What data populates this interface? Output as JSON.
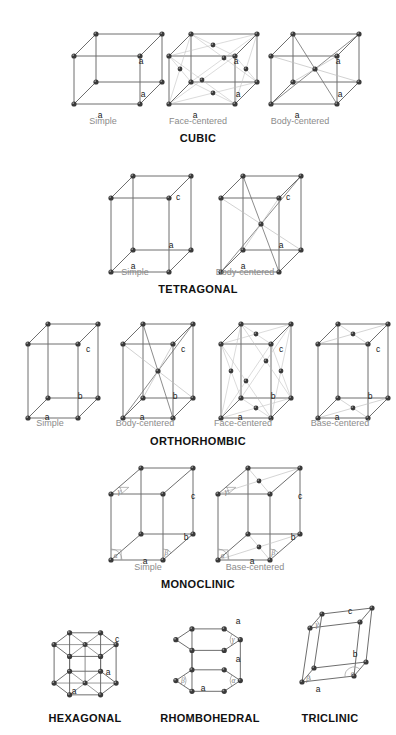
{
  "figure": {
    "title_visible": false,
    "background": "#ffffff",
    "node_color": "#3a3a3a",
    "edge_color": "#6e6e6e",
    "faint_edge_color": "#bdbdbd",
    "label_color": "#8b8b8b",
    "heading_color": "#111111"
  },
  "systems": [
    {
      "name": "CUBIC",
      "heading_x": 198,
      "heading_y": 132,
      "cells": [
        {
          "variant": "Simple",
          "label_x": 103,
          "label_y": 116,
          "shape": "box",
          "ox": 68,
          "oy": 30,
          "w": 66,
          "h": 48,
          "dx": 22,
          "dy": -22,
          "shear": 0,
          "lattice": "P",
          "axes": [
            {
              "text": "a",
              "x": 100,
              "y": 116
            },
            {
              "text": "a",
              "x": 143,
              "y": 95
            },
            {
              "text": "a",
              "x": 141,
              "y": 62
            }
          ]
        },
        {
          "variant": "Face-centered",
          "label_x": 198,
          "label_y": 116,
          "shape": "box",
          "ox": 163,
          "oy": 30,
          "w": 66,
          "h": 48,
          "dx": 22,
          "dy": -22,
          "shear": 0,
          "lattice": "F",
          "axes": [
            {
              "text": "a",
              "x": 195,
              "y": 116
            },
            {
              "text": "a",
              "x": 238,
              "y": 95
            },
            {
              "text": "a",
              "x": 236,
              "y": 62
            }
          ]
        },
        {
          "variant": "Body-centered",
          "label_x": 300,
          "label_y": 116,
          "shape": "box",
          "ox": 265,
          "oy": 30,
          "w": 66,
          "h": 48,
          "dx": 22,
          "dy": -22,
          "shear": 0,
          "lattice": "I",
          "axes": [
            {
              "text": "a",
              "x": 297,
              "y": 116
            },
            {
              "text": "a",
              "x": 340,
              "y": 95
            },
            {
              "text": "a",
              "x": 338,
              "y": 62
            }
          ]
        }
      ]
    },
    {
      "name": "TETRAGONAL",
      "heading_x": 198,
      "heading_y": 283,
      "cells": [
        {
          "variant": "Simple",
          "label_x": 135,
          "label_y": 267,
          "shape": "box",
          "ox": 105,
          "oy": 172,
          "w": 58,
          "h": 74,
          "dx": 22,
          "dy": -22,
          "shear": 0,
          "lattice": "P",
          "axes": [
            {
              "text": "a",
              "x": 133,
              "y": 267
            },
            {
              "text": "a",
              "x": 171,
              "y": 246
            },
            {
              "text": "c",
              "x": 178,
              "y": 198
            }
          ]
        },
        {
          "variant": "Body-centered",
          "label_x": 245,
          "label_y": 267,
          "shape": "box",
          "ox": 215,
          "oy": 172,
          "w": 58,
          "h": 74,
          "dx": 22,
          "dy": -22,
          "shear": 0,
          "lattice": "I",
          "axes": [
            {
              "text": "a",
              "x": 243,
              "y": 267
            },
            {
              "text": "a",
              "x": 281,
              "y": 246
            },
            {
              "text": "c",
              "x": 288,
              "y": 198
            }
          ]
        }
      ]
    },
    {
      "name": "ORTHORHOMBIC",
      "heading_x": 198,
      "heading_y": 435,
      "cells": [
        {
          "variant": "Simple",
          "label_x": 50,
          "label_y": 418,
          "shape": "box",
          "ox": 22,
          "oy": 318,
          "w": 50,
          "h": 74,
          "dx": 20,
          "dy": -20,
          "shear": 0,
          "lattice": "P",
          "axes": [
            {
              "text": "a",
              "x": 47,
              "y": 418
            },
            {
              "text": "b",
              "x": 80,
              "y": 397
            },
            {
              "text": "c",
              "x": 88,
              "y": 350
            }
          ]
        },
        {
          "variant": "Body-centered",
          "label_x": 145,
          "label_y": 418,
          "shape": "box",
          "ox": 117,
          "oy": 318,
          "w": 50,
          "h": 74,
          "dx": 20,
          "dy": -20,
          "shear": 0,
          "lattice": "I",
          "axes": [
            {
              "text": "a",
              "x": 142,
              "y": 418
            },
            {
              "text": "b",
              "x": 175,
              "y": 397
            },
            {
              "text": "c",
              "x": 183,
              "y": 350
            }
          ]
        },
        {
          "variant": "Face-centered",
          "label_x": 243,
          "label_y": 418,
          "shape": "box",
          "ox": 215,
          "oy": 318,
          "w": 50,
          "h": 74,
          "dx": 20,
          "dy": -20,
          "shear": 0,
          "lattice": "F",
          "axes": [
            {
              "text": "a",
              "x": 240,
              "y": 418
            },
            {
              "text": "b",
              "x": 273,
              "y": 397
            },
            {
              "text": "c",
              "x": 281,
              "y": 350
            }
          ]
        },
        {
          "variant": "Base-centered",
          "label_x": 340,
          "label_y": 418,
          "shape": "box",
          "ox": 312,
          "oy": 318,
          "w": 50,
          "h": 74,
          "dx": 20,
          "dy": -20,
          "shear": 0,
          "lattice": "C",
          "axes": [
            {
              "text": "a",
              "x": 337,
              "y": 418
            },
            {
              "text": "b",
              "x": 370,
              "y": 397
            },
            {
              "text": "c",
              "x": 378,
              "y": 350
            }
          ]
        }
      ]
    },
    {
      "name": "MONOCLINIC",
      "heading_x": 198,
      "heading_y": 578,
      "cells": [
        {
          "variant": "Simple",
          "label_x": 148,
          "label_y": 562,
          "shape": "box",
          "ox": 105,
          "oy": 468,
          "w": 52,
          "h": 66,
          "dx": 30,
          "dy": -26,
          "shear": 0,
          "lattice": "P",
          "angles": [
            "alpha",
            "beta",
            "gamma"
          ],
          "axes": [
            {
              "text": "a",
              "x": 145,
              "y": 562
            },
            {
              "text": "b",
              "x": 186,
              "y": 538
            },
            {
              "text": "c",
              "x": 193,
              "y": 497
            }
          ]
        },
        {
          "variant": "Base-centered",
          "label_x": 255,
          "label_y": 562,
          "shape": "box",
          "ox": 212,
          "oy": 468,
          "w": 52,
          "h": 66,
          "dx": 30,
          "dy": -26,
          "shear": 0,
          "lattice": "C",
          "angles": [
            "alpha",
            "beta",
            "gamma"
          ],
          "axes": [
            {
              "text": "a",
              "x": 252,
              "y": 562
            },
            {
              "text": "b",
              "x": 293,
              "y": 538
            },
            {
              "text": "c",
              "x": 300,
              "y": 497
            }
          ]
        }
      ]
    },
    {
      "name": "HEXAGONAL",
      "heading_x": 85,
      "heading_y": 712,
      "cells": [
        {
          "variant": "",
          "shape": "hex",
          "ox": 45,
          "oy": 600,
          "w": 62,
          "h": 62,
          "axes": [
            {
              "text": "a",
              "x": 74,
              "y": 692
            },
            {
              "text": "a",
              "x": 108,
              "y": 673
            },
            {
              "text": "c",
              "x": 117,
              "y": 640
            }
          ]
        }
      ]
    },
    {
      "name": "RHOMBOHEDRAL",
      "heading_x": 210,
      "heading_y": 712,
      "cells": [
        {
          "variant": "",
          "shape": "rhomb",
          "ox": 168,
          "oy": 600,
          "w": 62,
          "h": 62,
          "angles": [
            "alpha",
            "beta",
            "gamma"
          ],
          "axes": [
            {
              "text": "a",
              "x": 203,
              "y": 689
            },
            {
              "text": "a",
              "x": 238,
              "y": 660
            },
            {
              "text": "a",
              "x": 238,
              "y": 622
            }
          ]
        }
      ]
    },
    {
      "name": "TRICLINIC",
      "heading_x": 330,
      "heading_y": 712,
      "cells": [
        {
          "variant": "",
          "shape": "tri",
          "ox": 290,
          "oy": 594,
          "w": 52,
          "h": 70,
          "angles": [
            "alpha",
            "beta",
            "gamma"
          ],
          "axes": [
            {
              "text": "a",
              "x": 318,
              "y": 690
            },
            {
              "text": "b",
              "x": 355,
              "y": 655
            },
            {
              "text": "c",
              "x": 350,
              "y": 612
            }
          ]
        }
      ]
    }
  ],
  "angle_glyphs": {
    "alpha": "α",
    "beta": "β",
    "gamma": "γ"
  }
}
